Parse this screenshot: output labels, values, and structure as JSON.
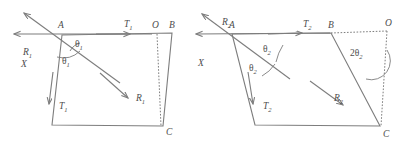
{
  "figure": {
    "type": "vector-force-diagram-pair",
    "stroke_color": "#7d7d7d",
    "label_color": "#4d4d4d",
    "background": "#ffffff"
  },
  "diagrams": [
    {
      "id": "left",
      "name": "diagram-theta-1",
      "points": {
        "A": {
          "label": "A",
          "x": 62,
          "y": 34
        },
        "B": {
          "label": "B",
          "x": 172,
          "y": 33
        },
        "O": {
          "label": "O",
          "x": 157,
          "y": 33
        },
        "C": {
          "label": "C",
          "x": 163,
          "y": 126
        },
        "D": {
          "x": 52,
          "y": 125
        }
      },
      "axis_label": "X",
      "vectors": [
        {
          "name": "R1-incoming",
          "label": "R",
          "sub": "1",
          "direction": "up-left"
        },
        {
          "name": "T1-horizontal",
          "label": "T",
          "sub": "1",
          "direction": "right"
        },
        {
          "name": "T1-down",
          "label": "T",
          "sub": "1",
          "direction": "down-left"
        },
        {
          "name": "R1-resultant",
          "label": "R",
          "sub": "1",
          "direction": "down-right"
        }
      ],
      "angles": [
        {
          "name": "theta-1-upper",
          "label": "θ",
          "sub": "1",
          "at": "A"
        },
        {
          "name": "theta-1-lower",
          "label": "θ",
          "sub": "1",
          "at": "A"
        }
      ]
    },
    {
      "id": "right",
      "name": "diagram-theta-2",
      "points": {
        "A": {
          "label": "A",
          "x": 232,
          "y": 34
        },
        "B": {
          "label": "B",
          "x": 331,
          "y": 33
        },
        "O": {
          "label": "O",
          "x": 386,
          "y": 31
        },
        "C": {
          "label": "C",
          "x": 380,
          "y": 126
        },
        "D": {
          "x": 255,
          "y": 125
        }
      },
      "axis_label": "X",
      "vectors": [
        {
          "name": "R2-incoming",
          "label": "R",
          "sub": "2",
          "direction": "up-left"
        },
        {
          "name": "T2-horizontal",
          "label": "T",
          "sub": "2",
          "direction": "right"
        },
        {
          "name": "T2-down",
          "label": "T",
          "sub": "2",
          "direction": "down-left"
        },
        {
          "name": "R2-resultant",
          "label": "R",
          "sub": "2",
          "direction": "down-right"
        }
      ],
      "angles": [
        {
          "name": "theta-2-upper",
          "label": "θ",
          "sub": "2",
          "at": "A"
        },
        {
          "name": "theta-2-lower",
          "label": "θ",
          "sub": "2",
          "at": "A"
        },
        {
          "name": "two-theta-2",
          "label": "2θ",
          "sub": "2",
          "at": "O"
        }
      ]
    }
  ],
  "labels": {
    "R": "R",
    "T": "T",
    "X": "X",
    "A": "A",
    "B": "B",
    "O": "O",
    "C": "C",
    "theta": "θ",
    "two_theta": "2θ",
    "sub1": "1",
    "sub2": "2"
  }
}
